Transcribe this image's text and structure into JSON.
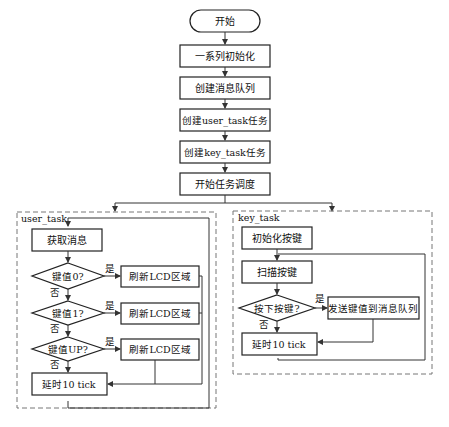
{
  "main_flow": {
    "start": "开始",
    "steps": [
      "一系列初始化",
      "创建消息队列",
      "创建user_task任务",
      "创建key_task任务",
      "开始任务调度"
    ]
  },
  "user_task": {
    "title": "user_task",
    "get_message": "获取消息",
    "decisions": [
      {
        "cond": "键值0?",
        "yes": "是",
        "no": "否",
        "action": "刷新LCD区域"
      },
      {
        "cond": "键值1?",
        "yes": "是",
        "no": "否",
        "action": "刷新LCD区域"
      },
      {
        "cond": "键值UP?",
        "yes": "是",
        "no": "否",
        "action": "刷新LCD区域"
      }
    ],
    "delay": "延时10 tick"
  },
  "key_task": {
    "title": "key_task",
    "init": "初始化按键",
    "scan": "扫描按键",
    "decision": {
      "cond": "按下按键?",
      "yes": "是",
      "no": "否",
      "action": "发送键值到消息队列"
    },
    "delay": "延时10 tick"
  }
}
